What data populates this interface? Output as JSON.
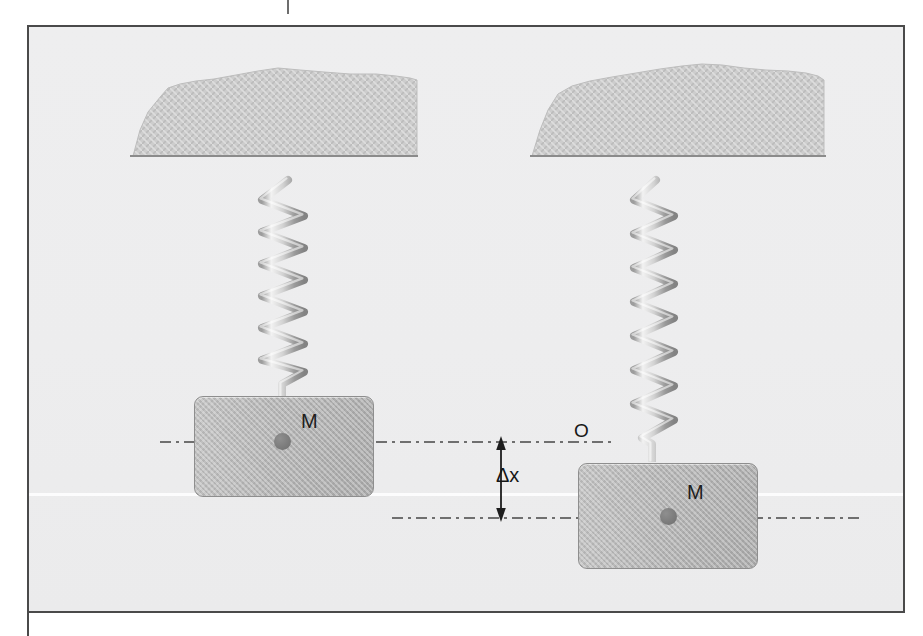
{
  "figure": {
    "background_color": "#eeeeef",
    "frame_color": "#4a4a4a"
  },
  "top_tick": {
    "name": "top-tick-mark"
  },
  "ceilings": [
    {
      "id": "left-ceiling",
      "label": "hatched-support-ceiling"
    },
    {
      "id": "right-ceiling",
      "label": "hatched-support-ceiling"
    }
  ],
  "springs": [
    {
      "id": "left-spring",
      "state": "relaxed",
      "coils": 8
    },
    {
      "id": "right-spring",
      "state": "stretched",
      "coils": 10
    }
  ],
  "blocks": [
    {
      "id": "left-block",
      "label": "M",
      "state": "equilibrium"
    },
    {
      "id": "right-block",
      "label": "M",
      "state": "displaced"
    }
  ],
  "annotations": {
    "origin_label": "O",
    "displacement_label": "Δx",
    "equilibrium_axis": "dash-dot reference line at equilibrium",
    "displaced_axis": "dash-dot reference line at displaced position"
  },
  "colors": {
    "block_fill": "#b4b4b4",
    "block_stroke": "#8e8e8e",
    "spring_metal": "#cfcfcf",
    "ceiling_fill": "#c9c9c9",
    "line": "#6f6f6f",
    "text": "#171717"
  }
}
